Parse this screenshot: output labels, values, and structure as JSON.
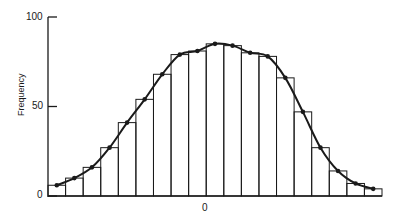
{
  "chart_data": {
    "type": "bar",
    "subtype": "histogram-with-smoothed-curve",
    "title": "",
    "xlabel": "",
    "ylabel": "Frequency",
    "ylim": [
      0,
      100
    ],
    "yticks": [
      0,
      50,
      100
    ],
    "xticks": [
      {
        "position": "center",
        "label": "0"
      }
    ],
    "grid": false,
    "legend": null,
    "bins": 19,
    "categories": [
      "1",
      "2",
      "3",
      "4",
      "5",
      "6",
      "7",
      "8",
      "9",
      "10",
      "11",
      "12",
      "13",
      "14",
      "15",
      "16",
      "17",
      "18",
      "19"
    ],
    "values": [
      6,
      10,
      16,
      27,
      41,
      54,
      68,
      79,
      81,
      85,
      84,
      80,
      78,
      66,
      47,
      27,
      14,
      7,
      4
    ],
    "curve_points": [
      6,
      10,
      16,
      27,
      41,
      54,
      68,
      79,
      81,
      85,
      84,
      80,
      78,
      66,
      47,
      27,
      14,
      7,
      4
    ],
    "series": [
      {
        "name": "Histogram",
        "type": "bar",
        "values": [
          6,
          10,
          16,
          27,
          41,
          54,
          68,
          79,
          81,
          85,
          84,
          80,
          78,
          66,
          47,
          27,
          14,
          7,
          4
        ]
      },
      {
        "name": "Fitted curve",
        "type": "line",
        "marker": "dot",
        "values": [
          6,
          10,
          16,
          27,
          41,
          54,
          68,
          79,
          81,
          85,
          84,
          80,
          78,
          66,
          47,
          27,
          14,
          7,
          4
        ]
      }
    ]
  },
  "axis": {
    "y_label": "Frequency",
    "y_tick_labels": [
      "0",
      "50",
      "100"
    ],
    "x_tick_label": "0"
  },
  "colors": {
    "ink": "#1a1a1a",
    "background": "#ffffff"
  }
}
